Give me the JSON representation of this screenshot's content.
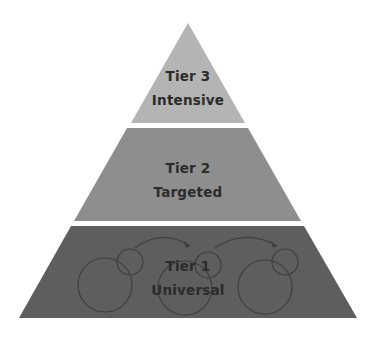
{
  "diagram": {
    "type": "pyramid",
    "tiers": [
      {
        "name": "Tier 3",
        "label": "Intensive",
        "color": "#b4b4b4",
        "position": "top"
      },
      {
        "name": "Tier 2",
        "label": "Targeted",
        "color": "#8e8e8e",
        "position": "middle"
      },
      {
        "name": "Tier 1",
        "label": "Universal",
        "color": "#5e5e5e",
        "position": "bottom"
      }
    ],
    "background": "#ffffff",
    "text_color": "#2b2b2b",
    "tier1_decoration": "cycle-circles-with-arrows"
  }
}
